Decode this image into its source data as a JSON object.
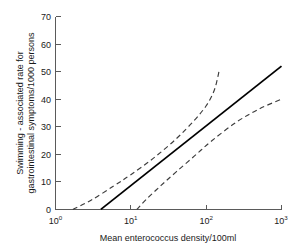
{
  "chart_data": {
    "type": "line",
    "title": "",
    "subtitle": "",
    "xlabel": "Mean enterococcus density/100ml",
    "ylabel": "Swimming - associated rate for gastrointestinal symptoms/1000 persons",
    "ylabel_line1": "Swimming - associated rate for",
    "ylabel_line2": "gastrointestinal symptoms/1000 persons",
    "xscale": "log",
    "yscale": "linear",
    "xlim": [
      1,
      1000
    ],
    "ylim": [
      0,
      70
    ],
    "grid": false,
    "legend": "none",
    "xticks": [
      1,
      10,
      100,
      1000
    ],
    "xtick_labels": [
      "10^0",
      "10^1",
      "10^2",
      "10^3"
    ],
    "xtick_mantissa": [
      "10",
      "10",
      "10",
      "10"
    ],
    "xtick_exponent": [
      "0",
      "1",
      "2",
      "3"
    ],
    "yticks": [
      0,
      10,
      20,
      30,
      40,
      50,
      60,
      70
    ],
    "ytick_labels": [
      "0",
      "10",
      "20",
      "30",
      "40",
      "50",
      "60",
      "70"
    ],
    "series": [
      {
        "name": "Fitted regression line",
        "style": "solid",
        "color": "#000000",
        "x": [
          4.0,
          10,
          31.6,
          100,
          316,
          1000
        ],
        "y": [
          0.0,
          8.6,
          19.4,
          30.3,
          41.1,
          52.0
        ]
      },
      {
        "name": "Upper 95% confidence limit",
        "style": "dashed",
        "color": "#3c3c3c",
        "x": [
          1.7,
          3.0,
          6.0,
          10,
          20,
          40,
          70,
          100,
          125,
          140,
          150
        ],
        "y": [
          0.0,
          3.4,
          8.6,
          12.6,
          18.6,
          25.6,
          32.4,
          37.6,
          42.5,
          47.0,
          51.0
        ]
      },
      {
        "name": "Lower 95% confidence limit",
        "style": "dashed",
        "color": "#3c3c3c",
        "x": [
          12.0,
          16,
          25,
          40,
          70,
          120,
          250,
          500,
          1000
        ],
        "y": [
          0.0,
          3.6,
          8.6,
          13.6,
          19.4,
          25.0,
          31.6,
          36.4,
          40.0
        ]
      }
    ]
  },
  "axes": {
    "x_axis_name": "x-axis",
    "y_axis_name": "y-axis"
  }
}
